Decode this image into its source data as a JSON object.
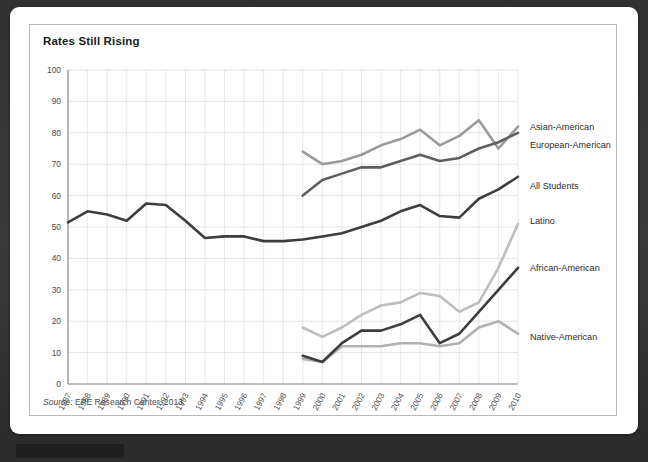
{
  "card": {
    "title": "Rates Still Rising",
    "source_label": "Source:",
    "source_text": " EPE Research Center, 2013."
  },
  "chart_data": {
    "type": "line",
    "title": "Rates Still Rising",
    "xlabel": "",
    "ylabel": "",
    "ylim": [
      0,
      100
    ],
    "ytick_step": 10,
    "yticks": [
      0,
      10,
      20,
      30,
      40,
      50,
      60,
      70,
      80,
      90,
      100
    ],
    "x": [
      1987,
      1988,
      1989,
      1990,
      1991,
      1992,
      1993,
      1994,
      1995,
      1996,
      1997,
      1998,
      1999,
      2000,
      2001,
      2002,
      2003,
      2004,
      2005,
      2006,
      2007,
      2008,
      2009,
      2010
    ],
    "xticks": [
      "1987",
      "1988",
      "1989",
      "1990",
      "1991",
      "1992",
      "1993",
      "1994",
      "1995",
      "1996",
      "1997",
      "1998",
      "1999",
      "2000",
      "2001",
      "2002",
      "2003",
      "2004",
      "2005",
      "2006",
      "2007",
      "2008",
      "2009",
      "2010"
    ],
    "grid": true,
    "legend_position": "right-inline",
    "series": [
      {
        "name": "Asian-American",
        "color": "#9a9a9a",
        "label_y": 82,
        "x": [
          1999,
          2000,
          2001,
          2002,
          2003,
          2004,
          2005,
          2006,
          2007,
          2008,
          2009,
          2010
        ],
        "values": [
          74,
          70,
          71,
          73,
          76,
          78,
          81,
          76,
          79,
          84,
          75,
          82
        ]
      },
      {
        "name": "European-American",
        "color": "#5e5e5e",
        "label_y": 76,
        "x": [
          1999,
          2000,
          2001,
          2002,
          2003,
          2004,
          2005,
          2006,
          2007,
          2008,
          2009,
          2010
        ],
        "values": [
          60,
          65,
          67,
          69,
          69,
          71,
          73,
          71,
          72,
          75,
          77,
          80
        ]
      },
      {
        "name": "All Students",
        "color": "#3d3d3d",
        "label_y": 63,
        "x": [
          1987,
          1988,
          1989,
          1990,
          1991,
          1992,
          1993,
          1994,
          1995,
          1996,
          1997,
          1998,
          1999,
          2000,
          2001,
          2002,
          2003,
          2004,
          2005,
          2006,
          2007,
          2008,
          2009,
          2010
        ],
        "values": [
          51.5,
          55,
          54,
          52,
          57.5,
          57,
          52,
          46.5,
          47,
          47,
          45.5,
          45.5,
          46,
          47,
          48,
          50,
          52,
          55,
          57,
          53.5,
          53,
          59,
          62,
          66
        ]
      },
      {
        "name": "Latino",
        "color": "#bdbdbd",
        "label_y": 52,
        "x": [
          1999,
          2000,
          2001,
          2002,
          2003,
          2004,
          2005,
          2006,
          2007,
          2008,
          2009,
          2010
        ],
        "values": [
          18,
          15,
          18,
          22,
          25,
          26,
          29,
          28,
          23,
          26,
          37,
          51
        ]
      },
      {
        "name": "African-American",
        "color": "#3d3d3d",
        "label_y": 37,
        "x": [
          1999,
          2000,
          2001,
          2002,
          2003,
          2004,
          2005,
          2006,
          2007,
          2008,
          2009,
          2010
        ],
        "values": [
          9,
          7,
          13,
          17,
          17,
          19,
          22,
          13,
          16,
          23,
          30,
          37
        ]
      },
      {
        "name": "Native-American",
        "color": "#b0b0b0",
        "label_y": 15,
        "x": [
          1999,
          2000,
          2001,
          2002,
          2003,
          2004,
          2005,
          2006,
          2007,
          2008,
          2009,
          2010
        ],
        "values": [
          8,
          7,
          12,
          12,
          12,
          13,
          13,
          12,
          13,
          18,
          20,
          16
        ]
      }
    ]
  }
}
